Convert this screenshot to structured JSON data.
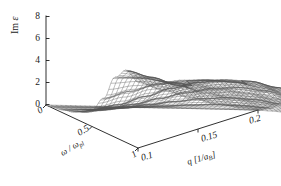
{
  "figure": {
    "background_color": "#ffffff",
    "ink_color": "#1a1a1a",
    "mesh_color": "#555555"
  },
  "axes": {
    "z": {
      "title_prefix": "Im ",
      "title_symbol": "ε",
      "ticks": [
        "8",
        "6",
        "4",
        "2",
        "0"
      ],
      "values": [
        8,
        6,
        4,
        2,
        0
      ],
      "range": [
        0,
        8
      ]
    },
    "omega": {
      "title_numerator": "ω",
      "title_separator": " / ",
      "title_denominator": "ω",
      "title_subscript": "pl",
      "title_full": "ω / ωpl",
      "ticks": [
        "0",
        "0.5",
        "1"
      ],
      "values": [
        0,
        0.5,
        1
      ],
      "range": [
        0,
        1
      ]
    },
    "q": {
      "title_full": "q [1/aB]",
      "title_main": "q [1/a",
      "title_subscript": "B",
      "title_tail": "]",
      "ticks": [
        "0.1",
        "0.15",
        "0.2"
      ],
      "values": [
        0.1,
        0.15,
        0.2
      ],
      "range": [
        0.1,
        0.2
      ]
    }
  },
  "chart_data": {
    "type": "surface",
    "title": "",
    "xlabel": "q [1/aB]",
    "ylabel": "ω / ωpl",
    "zlabel": "Im ε",
    "grid": false,
    "legend": "none",
    "render_style": "wireframe-mesh",
    "xlim": [
      0.1,
      0.2
    ],
    "ylim": [
      0,
      1
    ],
    "zlim": [
      0,
      8
    ],
    "x": [
      0.1,
      0.1125,
      0.125,
      0.1375,
      0.15,
      0.1625,
      0.175,
      0.1875,
      0.2
    ],
    "y": [
      0,
      0.125,
      0.25,
      0.375,
      0.5,
      0.625,
      0.75,
      0.875,
      1.0
    ],
    "z_note": "z[i][j] = Im epsilon at x=q[j], y=omega[i]",
    "z": [
      [
        0.0,
        0.0,
        0.0,
        0.0,
        0.0,
        0.0,
        0.0,
        0.0,
        0.0
      ],
      [
        0.15,
        0.2,
        0.3,
        0.45,
        0.6,
        0.75,
        0.85,
        0.8,
        0.65
      ],
      [
        0.4,
        0.55,
        0.8,
        1.15,
        1.5,
        1.8,
        1.95,
        1.85,
        1.5
      ],
      [
        0.8,
        1.1,
        1.6,
        2.2,
        2.8,
        3.2,
        3.35,
        3.1,
        2.5
      ],
      [
        1.5,
        2.0,
        2.8,
        3.6,
        4.2,
        4.5,
        4.4,
        3.9,
        3.1
      ],
      [
        3.0,
        3.7,
        4.4,
        4.8,
        4.9,
        4.7,
        4.3,
        3.7,
        2.9
      ],
      [
        5.4,
        5.4,
        5.1,
        4.8,
        4.5,
        4.2,
        3.8,
        3.3,
        2.6
      ],
      [
        6.5,
        5.9,
        5.2,
        4.6,
        4.2,
        3.9,
        3.6,
        3.2,
        2.5
      ],
      [
        5.9,
        5.2,
        4.6,
        4.1,
        3.8,
        3.6,
        3.4,
        3.0,
        2.4
      ]
    ],
    "features": [
      {
        "name": "plasmon-peak",
        "omega": 0.93,
        "q": 0.1,
        "z": 6.5
      },
      {
        "name": "secondary-ridge",
        "omega": 0.82,
        "q": 0.17,
        "z": 3.8
      }
    ]
  }
}
